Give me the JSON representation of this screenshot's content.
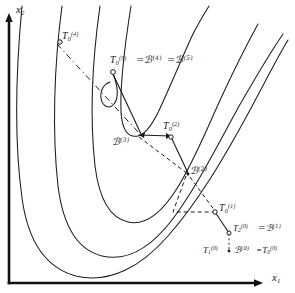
{
  "figure": {
    "type": "contour-search-path-diagram",
    "axes": {
      "x_label": "x",
      "x_sub": "1",
      "y_label": "x",
      "y_sub": "2",
      "x_axis_name": "x1-axis",
      "y_axis_name": "x2-axis"
    },
    "labels": [
      {
        "id": "t0_4",
        "name": "label-T0-4",
        "base": "T",
        "sub": "0",
        "sup": "(4)",
        "x": 62,
        "y": 31
      },
      {
        "id": "t0_3",
        "name": "label-T0-3",
        "base": "T",
        "sub": "0",
        "sup": "(3)",
        "x": 110,
        "y": 55
      },
      {
        "id": "eq_b4",
        "name": "label-eq-B-4",
        "base": "=ℬ",
        "sub": "",
        "sup": "(4)",
        "x": 136,
        "y": 55
      },
      {
        "id": "eq_b5",
        "name": "label-eq-B-5",
        "base": "=ℬ",
        "sub": "",
        "sup": "(5)",
        "x": 167,
        "y": 55
      },
      {
        "id": "b3",
        "name": "label-B-3",
        "base": "ℬ",
        "sub": "",
        "sup": "(3)",
        "x": 122,
        "y": 137
      },
      {
        "id": "t0_2",
        "name": "label-T0-2",
        "base": "T",
        "sub": "0",
        "sup": "(2)",
        "x": 163,
        "y": 126
      },
      {
        "id": "b2",
        "name": "label-B-2",
        "base": "ℬ",
        "sub": "",
        "sup": "(2)",
        "x": 190,
        "y": 166
      },
      {
        "id": "t0_1",
        "name": "label-T0-1",
        "base": "T",
        "sub": "0",
        "sup": "(1)",
        "x": 219,
        "y": 205
      },
      {
        "id": "t2_0",
        "name": "label-T2-0",
        "base": "T",
        "sub": "2",
        "sup": "(0)",
        "x": 232,
        "y": 226
      },
      {
        "id": "eq_b1",
        "name": "label-eq-B-1",
        "base": "=ℬ",
        "sub": "",
        "sup": "(1)",
        "x": 258,
        "y": 226
      },
      {
        "id": "t1_0",
        "name": "label-T1-0",
        "base": "T",
        "sub": "1",
        "sup": "(0)",
        "x": 215,
        "y": 247
      },
      {
        "id": "b0",
        "name": "label-B-0",
        "base": "ℬ",
        "sub": "",
        "sup": "(0)",
        "x": 242,
        "y": 247
      },
      {
        "id": "eq_t0_0",
        "name": "label-eq-T0-0",
        "base": "=T",
        "sub": "0",
        "sup": "(0)",
        "x": 263,
        "y": 247
      }
    ],
    "points": [
      {
        "name": "point-T0-4",
        "x": 60,
        "y": 41
      },
      {
        "name": "point-T0-3",
        "x": 113,
        "y": 72
      },
      {
        "name": "point-B-3",
        "x": 139,
        "y": 135
      },
      {
        "name": "point-T0-2",
        "x": 171,
        "y": 136
      },
      {
        "name": "point-B-2",
        "x": 188,
        "y": 173
      },
      {
        "name": "point-T0-1",
        "x": 215,
        "y": 212
      },
      {
        "name": "point-T2-0",
        "x": 229,
        "y": 233
      },
      {
        "name": "point-T1-0",
        "x": 229,
        "y": 251
      }
    ],
    "contours": {
      "count": 4,
      "shape": "nested-banana-valley",
      "style": "solid thin hand-drawn"
    },
    "path_segments": [
      {
        "name": "segment-solid-T03-to-B3",
        "style": "solid"
      },
      {
        "name": "segment-solid-B3-to-T02",
        "style": "solid"
      },
      {
        "name": "segment-dashed-T04-diag",
        "style": "dashed"
      },
      {
        "name": "segment-dashed-T02-to-B2",
        "style": "dashed"
      },
      {
        "name": "segment-dashed-B2-right-angle",
        "style": "dashed"
      },
      {
        "name": "segment-dashed-B2-to-T01",
        "style": "dashed"
      },
      {
        "name": "segment-solid-T01-to-T20",
        "style": "solid"
      },
      {
        "name": "segment-dotted-T20-to-T10",
        "style": "dotted"
      }
    ],
    "colors": {
      "ink": "#1a1a1a",
      "paper": "#ffffff",
      "axis": "#111111"
    }
  }
}
